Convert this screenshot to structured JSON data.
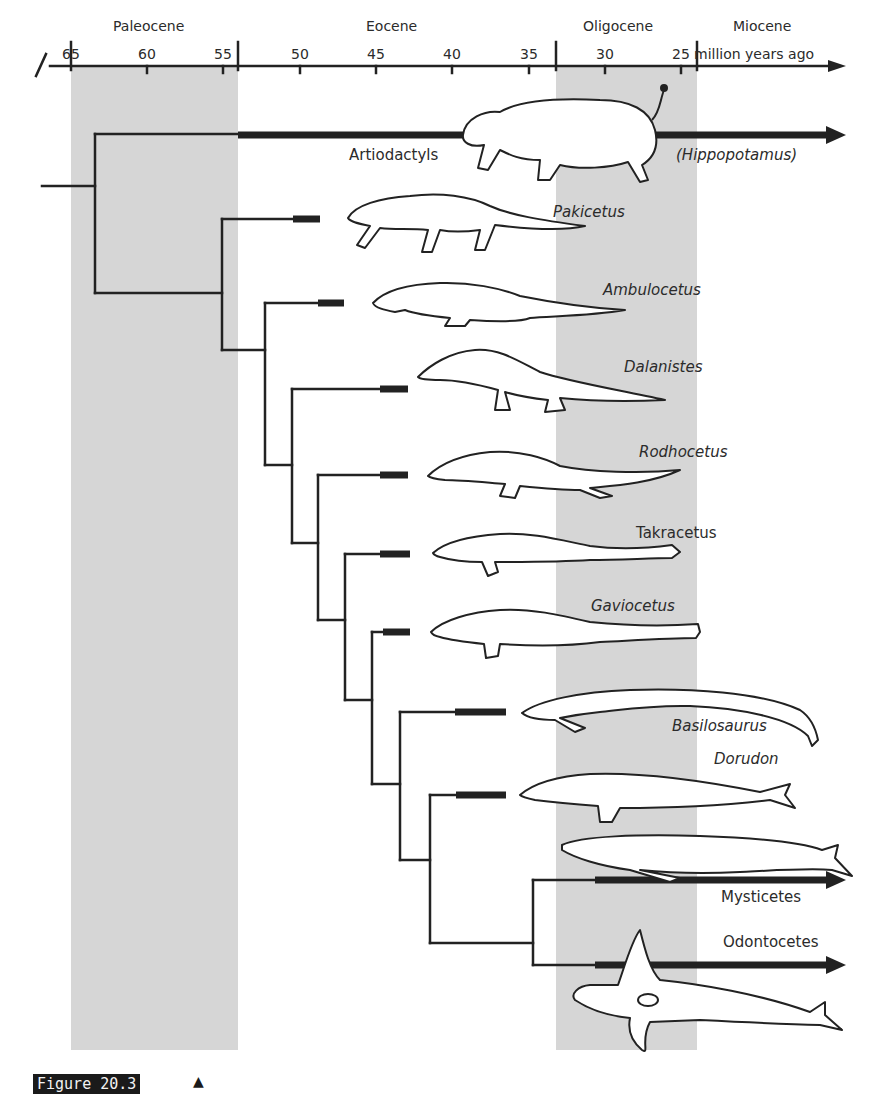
{
  "figure": {
    "caption": "Figure 20.3",
    "caption_marker": "▲"
  },
  "timeline": {
    "unit_label": "million years ago",
    "ticks": [
      "65",
      "60",
      "55",
      "50",
      "45",
      "40",
      "35",
      "30",
      "25"
    ],
    "epochs": [
      {
        "name": "Paleocene"
      },
      {
        "name": "Eocene"
      },
      {
        "name": "Oligocene"
      },
      {
        "name": "Miocene"
      }
    ]
  },
  "taxa": [
    {
      "name": "Artiodactyls",
      "italic": false
    },
    {
      "name": "(Hippopotamus)",
      "italic": true
    },
    {
      "name": "Pakicetus",
      "italic": true
    },
    {
      "name": "Ambulocetus",
      "italic": true
    },
    {
      "name": "Dalanistes",
      "italic": true
    },
    {
      "name": "Rodhocetus",
      "italic": true
    },
    {
      "name": "Takracetus",
      "italic": false
    },
    {
      "name": "Gaviocetus",
      "italic": true
    },
    {
      "name": "Basilosaurus",
      "italic": true
    },
    {
      "name": "Dorudon",
      "italic": true
    },
    {
      "name": "Mysticetes",
      "italic": false
    },
    {
      "name": "Odontocetes",
      "italic": false
    }
  ],
  "colors": {
    "band": "#d6d6d6",
    "line": "#222222",
    "text": "#2b2b2b"
  }
}
